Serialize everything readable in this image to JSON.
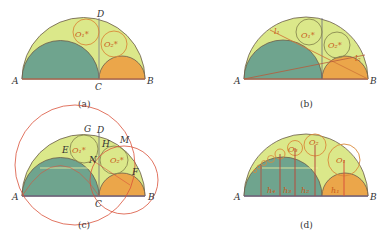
{
  "colors": {
    "outer_fill": "#dbe88a",
    "left_fill": "#6fa48e",
    "right_fill": "#eba64a",
    "circle_stroke": "#d98a3a",
    "red_line": "#d9523a",
    "dark_line": "#5a5a6a",
    "base_line": "#c2664a"
  },
  "panels": [
    {
      "id": "a",
      "caption": "(a)",
      "points": {
        "A": "A",
        "B": "B",
        "C": "C",
        "D": "D"
      },
      "circles": [
        "O₁*",
        "O₂*"
      ]
    },
    {
      "id": "b",
      "caption": "(b)",
      "points": {
        "A": "A",
        "B": "B"
      },
      "lines": [
        "l₁",
        "l₂"
      ],
      "circles": [
        "O₁*",
        "O₂*"
      ]
    },
    {
      "id": "c",
      "caption": "(c)",
      "points": {
        "A": "A",
        "B": "B",
        "C": "C",
        "D": "D",
        "G": "G",
        "H": "H",
        "M": "M",
        "E": "E",
        "N": "N",
        "F": "F"
      },
      "circles": [
        "O₁*",
        "O₂*"
      ]
    },
    {
      "id": "d",
      "caption": "(d)",
      "points": {
        "A": "A",
        "B": "B"
      },
      "circles": [
        "O₁",
        "O₂",
        "O₃"
      ],
      "heights": [
        "h₄",
        "h₃",
        "h₂",
        "h₁"
      ]
    }
  ]
}
